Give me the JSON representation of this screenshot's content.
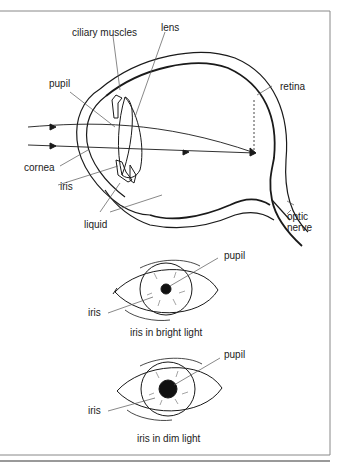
{
  "diagram": {
    "main_eye": {
      "labels": {
        "ciliary_muscles": "ciliary muscles",
        "lens": "lens",
        "pupil": "pupil",
        "retina": "retina",
        "cornea": "cornea",
        "iris": "iris",
        "liquid": "liquid",
        "optic_nerve_line1": "optic",
        "optic_nerve_line2": "nerve"
      }
    },
    "bright_eye": {
      "caption": "iris in bright light",
      "labels": {
        "pupil": "pupil",
        "iris": "iris"
      }
    },
    "dim_eye": {
      "caption": "iris in dim light",
      "labels": {
        "pupil": "pupil",
        "iris": "iris"
      }
    },
    "colors": {
      "line": "#1a1a1a",
      "leader": "#555555",
      "frame": "#666666"
    }
  }
}
